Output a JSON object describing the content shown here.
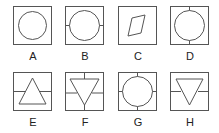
{
  "options": [
    {
      "label": "A",
      "figure": "circle-in-square"
    },
    {
      "label": "B",
      "figure": "circle-with-horizontal-ticks"
    },
    {
      "label": "C",
      "figure": "parallelogram-in-square"
    },
    {
      "label": "D",
      "figure": "circle-with-vertical-ticks"
    },
    {
      "label": "E",
      "figure": "triangle-up-with-horizontal-line"
    },
    {
      "label": "F",
      "figure": "triangle-down-with-cross-lines"
    },
    {
      "label": "G",
      "figure": "circle-with-four-ticks"
    },
    {
      "label": "H",
      "figure": "triangle-down-with-horizontal-line"
    }
  ],
  "colors": {
    "stroke": "#555555",
    "text": "#222222"
  }
}
